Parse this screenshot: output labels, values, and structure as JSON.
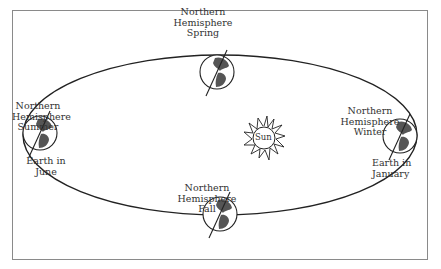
{
  "diagram": {
    "type": "earth-orbit-seasons",
    "sun": {
      "label": "Sun"
    },
    "positions": [
      {
        "id": "spring",
        "season_label": "Northern\nHemisphere\nSpring"
      },
      {
        "id": "summer",
        "season_label": "Northern\nHemisphere\nSummer",
        "month_label": "Earth in\nJune"
      },
      {
        "id": "winter",
        "season_label": "Northern\nHemisphere\nWinter",
        "month_label": "Earth in\nJanuary"
      },
      {
        "id": "fall",
        "season_label": "Northern\nHemisphere\nFall"
      }
    ]
  },
  "colors": {
    "line": "#222222",
    "frame": "#8a8a8a",
    "land": "#555555",
    "text": "#333333"
  }
}
